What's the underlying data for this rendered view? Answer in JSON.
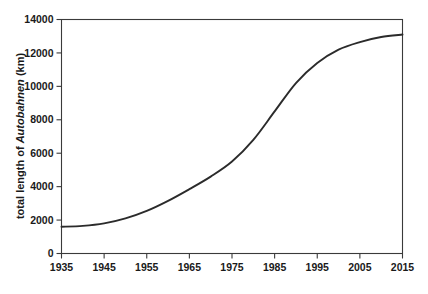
{
  "chart_data": {
    "type": "line",
    "title": "",
    "xlabel": "",
    "ylabel": "total length of Autobahnen (km)",
    "ylabel_parts": {
      "prefix": "total length of ",
      "emphasis": "Autobahnen",
      "suffix": " (km)"
    },
    "xlim": [
      1935,
      2015
    ],
    "ylim": [
      0,
      14000
    ],
    "grid": false,
    "legend": null,
    "xticks": [
      1935,
      1945,
      1955,
      1965,
      1975,
      1985,
      1995,
      2005,
      2015
    ],
    "xtick_labels": [
      "1935",
      "1945",
      "1955",
      "1965",
      "1975",
      "1985",
      "1995",
      "2005",
      "2015"
    ],
    "yticks": [
      0,
      2000,
      4000,
      6000,
      8000,
      10000,
      12000,
      14000
    ],
    "ytick_labels": [
      "0",
      "2000",
      "4000",
      "6000",
      "8000",
      "10000",
      "12000",
      "14000"
    ],
    "series": [
      {
        "name": "total length of Autobahnen",
        "color": "#2b2b2b",
        "x": [
          1935,
          1940,
          1945,
          1950,
          1955,
          1960,
          1965,
          1970,
          1975,
          1980,
          1985,
          1990,
          1995,
          2000,
          2005,
          2010,
          2015
        ],
        "values": [
          1600,
          1650,
          1800,
          2100,
          2550,
          3150,
          3850,
          4600,
          5500,
          6800,
          8500,
          10200,
          11400,
          12200,
          12650,
          12950,
          13100
        ]
      }
    ],
    "annotations": []
  },
  "figure": {
    "background_color": "#ffffff",
    "axis_color": "#3a3a3a",
    "text_color": "#1a1a1a"
  }
}
